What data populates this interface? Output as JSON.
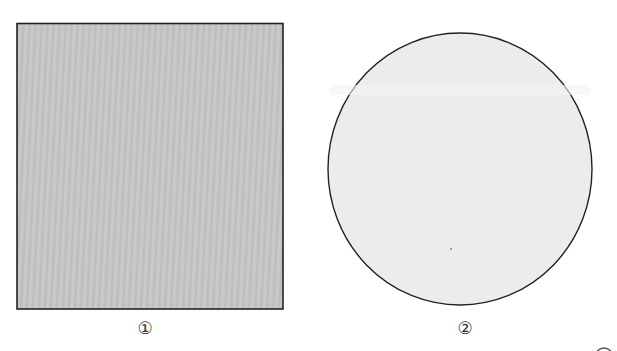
{
  "figure": {
    "shapes": [
      {
        "id": "shape-1",
        "type": "square",
        "label": "①",
        "fill": "#c4c4c4",
        "stroke": "#222222"
      },
      {
        "id": "shape-2",
        "type": "circle",
        "label": "②",
        "fill": "#ececec",
        "stroke": "#222222"
      }
    ]
  }
}
